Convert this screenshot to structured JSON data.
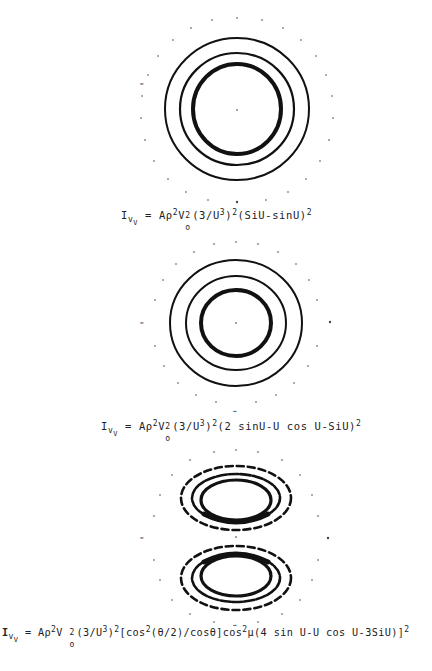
{
  "figure": {
    "panels": [
      {
        "id": "panel-1",
        "pattern": "three concentric rings, innermost thickest",
        "center": [
          237,
          109
        ],
        "rings_r": [
          72,
          57,
          44
        ],
        "formula": {
          "lhs": "I",
          "lhs_sub": "V",
          "lhs_subsub": "V",
          "rhs_parts": [
            "= A",
            "ρ",
            "2",
            "V",
            "2",
            "o",
            "(3/U",
            "3",
            ")",
            "2",
            "(SiU-sinU)",
            "2"
          ],
          "text": "Iv_V = Aρ²V₀²(3/U³)²(SiU-sinU)²"
        }
      },
      {
        "id": "panel-2",
        "pattern": "three concentric rings, innermost thickest",
        "center": [
          236,
          323
        ],
        "rings_r": [
          66,
          50,
          35
        ],
        "formula": {
          "text": "Iv_V = Aρ²V₀²(3/U³)²(2 sinU-U cos U-SiU)²"
        }
      },
      {
        "id": "panel-3",
        "pattern": "two-lobed (upper and lower) dashed elliptical rings",
        "center": [
          236,
          537
        ],
        "lobes_cy": [
          498,
          578
        ],
        "formula": {
          "text": "Iv_V = Aρ²V₀²(3/U³)²[cos²(θ/2)/cosθ]cos²μ(4 sin U-U cos U-3SiU)²"
        }
      }
    ]
  },
  "formulas": {
    "f1": {
      "I": "I",
      "v": "v",
      "V": "V",
      "eq": "= Aρ",
      "s2a": "2",
      "Vo": "V",
      "s2b": "2",
      "o": "o",
      "p1": "(3/U",
      "s3": "3",
      "p2": ")",
      "s2c": "2",
      "p3": "(SiU-sinU)",
      "s2d": "2"
    },
    "f2": {
      "I": "I",
      "v": "v",
      "V": "V",
      "eq": "= Aρ",
      "s2a": "2",
      "Vo": "V",
      "s2b": "2",
      "o": "o",
      "p1": "(3/U",
      "s3": "3",
      "p2": ")",
      "s2c": "2",
      "p3": "(2 sinU-U cos U-SiU)",
      "s2d": "2"
    },
    "f3": {
      "I": "I",
      "v": "v",
      "V": "V",
      "eq": "= Aρ",
      "s2a": "2",
      "Vo": "V ",
      "s2b": "2",
      "o": "o",
      "p1": "(3/U",
      "s3": "3",
      "p2": ")",
      "s2c": "2",
      "p3": "[cos",
      "s2e": "2",
      "p4": "(θ/2)/cosθ]cos",
      "s2f": "2",
      "p5": "μ(4 sin U-U cos U-3SiU)]",
      "s2d": "2"
    }
  }
}
